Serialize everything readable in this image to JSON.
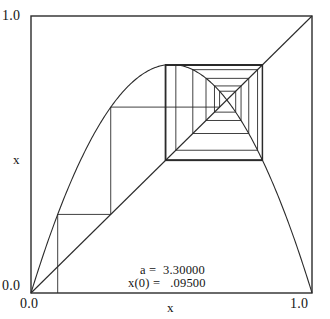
{
  "figure": {
    "kind": "cobweb-diagram",
    "background_color": "#ffffff",
    "line_color": "#2b2b2b"
  },
  "axes": {
    "x_title": "x",
    "y_title": "x",
    "x_ticks": [
      "0.0",
      "1.0"
    ],
    "y_ticks": [
      "0.0",
      "1.0"
    ],
    "x_tick_left": "0.0",
    "x_tick_right": "1.0",
    "y_tick_bottom": "0.0",
    "y_tick_top": "1.0"
  },
  "annotations": {
    "a_label": "a =  3.30000",
    "x0_label": "x(0) =   .09500"
  },
  "chart_data": {
    "type": "line",
    "title": "",
    "subtitle": "",
    "xlabel": "x",
    "ylabel": "x",
    "xlim": [
      0.0,
      1.0
    ],
    "ylim": [
      0.0,
      1.0
    ],
    "grid": false,
    "legend": "none",
    "parameters": {
      "a": 3.3,
      "x0": 0.095,
      "iterations": 40
    },
    "series": [
      {
        "name": "logistic map f(x) = a*x*(1-x)",
        "role": "map-curve",
        "equation": "y = 3.3 * x * (1 - x)",
        "x": [
          0.0,
          0.05,
          0.1,
          0.15,
          0.2,
          0.25,
          0.3,
          0.35,
          0.4,
          0.45,
          0.5,
          0.55,
          0.6,
          0.65,
          0.7,
          0.75,
          0.8,
          0.85,
          0.9,
          0.95,
          1.0
        ],
        "values": [
          0.0,
          0.15675,
          0.297,
          0.42075,
          0.528,
          0.61875,
          0.693,
          0.75075,
          0.792,
          0.81675,
          0.825,
          0.81675,
          0.792,
          0.75075,
          0.693,
          0.61875,
          0.528,
          0.42075,
          0.297,
          0.15675,
          0.0
        ]
      },
      {
        "name": "identity line y = x",
        "role": "diagonal",
        "x": [
          0.0,
          1.0
        ],
        "values": [
          0.0,
          1.0
        ]
      },
      {
        "name": "cobweb orbit",
        "role": "cobweb",
        "orbit": [
          0.095,
          0.283717,
          0.671122,
          0.728434,
          0.652918,
          0.747561,
          0.622792,
          0.774873,
          0.57579,
          0.806242,
          0.515397,
          0.82421,
          0.477828,
          0.823463,
          0.47949,
          0.824025,
          0.47824,
          0.823632,
          0.479116,
          0.823917,
          0.478481,
          0.823716,
          0.478928,
          0.823859,
          0.47861,
          0.823758,
          0.478835,
          0.82383,
          0.478675,
          0.823779,
          0.478788,
          0.823815,
          0.478708,
          0.82379,
          0.478765,
          0.823807,
          0.478725,
          0.823795,
          0.478753,
          0.823804,
          0.478733
        ]
      }
    ],
    "fixed_points": {
      "period_2_low": 0.478733,
      "period_2_high": 0.823804,
      "unstable_fixed_point": 0.69697
    }
  }
}
